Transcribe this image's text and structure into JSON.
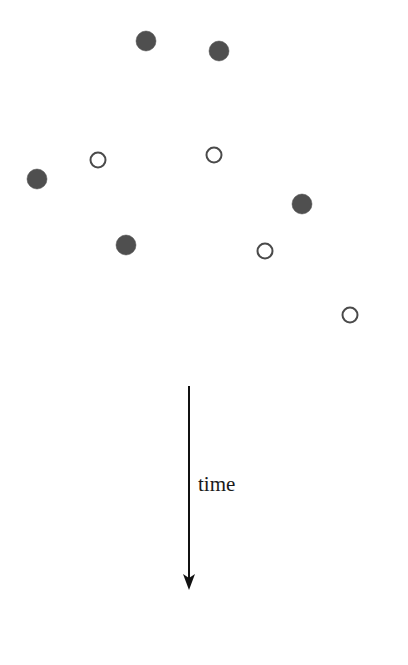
{
  "figure": {
    "width": 408,
    "height": 665,
    "background_color": "#ffffff"
  },
  "axis": {
    "label": "time",
    "label_x": 198,
    "label_baseline_y": 491,
    "line_x": 189,
    "line_top_y": 386,
    "line_tip_y": 590,
    "line_width": 2,
    "head_width": 12,
    "head_length": 16,
    "color": "#111111"
  },
  "legend_semantics": {
    "filled_marker_name": "filled-circle-marker",
    "open_marker_name": "open-circle-marker"
  },
  "chart_data": {
    "type": "scatter",
    "title": "",
    "xlabel": "",
    "ylabel": "time",
    "grid": false,
    "legend_position": "none",
    "axes_visible": false,
    "xlim": [
      0,
      408
    ],
    "ylim": [
      0,
      665
    ],
    "note": "Coordinates are in pixel space of the original figure; y increases downward along the time arrow.",
    "marker_styles": {
      "filled": {
        "fill_color": "#4f4f4f",
        "edge_color": "#4f4f4f",
        "diameter": 20
      },
      "open": {
        "fill_color": "#ffffff",
        "edge_color": "#4a4a4a",
        "edge_width": 2,
        "diameter": 17
      }
    },
    "series": [
      {
        "name": "filled",
        "style": "filled",
        "points": [
          {
            "x": 146,
            "y": 41
          },
          {
            "x": 219,
            "y": 51
          },
          {
            "x": 37,
            "y": 179
          },
          {
            "x": 302,
            "y": 204
          },
          {
            "x": 126,
            "y": 245
          }
        ]
      },
      {
        "name": "open",
        "style": "open",
        "points": [
          {
            "x": 98,
            "y": 160
          },
          {
            "x": 214,
            "y": 155
          },
          {
            "x": 265,
            "y": 251
          },
          {
            "x": 350,
            "y": 315
          }
        ]
      }
    ]
  }
}
